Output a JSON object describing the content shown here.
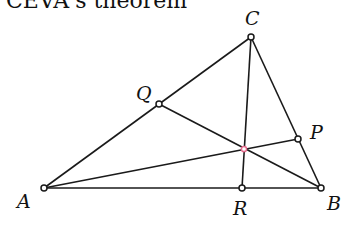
{
  "title": "CEVA's theorem",
  "points": {
    "A": {
      "label": "A"
    },
    "B": {
      "label": "B"
    },
    "C": {
      "label": "C"
    },
    "P": {
      "label": "P"
    },
    "Q": {
      "label": "Q"
    },
    "R": {
      "label": "R"
    }
  },
  "colors": {
    "line": "#1a1a1a",
    "vertex_fill": "#ffffff",
    "concurrency_point": "#e46a8c"
  }
}
